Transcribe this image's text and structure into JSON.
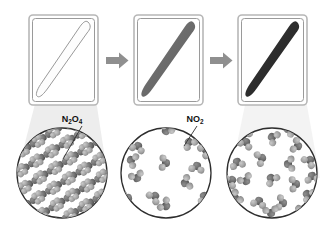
{
  "figure": {
    "width": 334,
    "height": 227,
    "background_color": "#ffffff"
  },
  "colors": {
    "tube_border_outer": "#b7b7b7",
    "tube_border_inner": "#9a9a9a",
    "tube_fill": "#ffffff",
    "sample_stage1": "#fdfdfd",
    "sample_stage1_outline": "#8d8d8d",
    "sample_stage2": "#6a6a6a",
    "sample_stage3": "#2b2b2b",
    "arrow": "#8f8f8f",
    "circle_outline": "#2d2d2d",
    "circle_fill": "#ffffff",
    "glow_cone": "#ececec",
    "atom_nitrogen": "#6e6e6e",
    "atom_oxygen": "#a8a8a8",
    "label_color": "#111111",
    "leader_line": "#2d2d2d"
  },
  "panels": [
    {
      "id": "panel-1",
      "stage": "solid",
      "sample_label": "colorless solid",
      "sample_color": "#fdfdfd",
      "magnified_state": "crystalline-lattice"
    },
    {
      "id": "panel-2",
      "stage": "partial-dissociation",
      "sample_label": "pale brown gas",
      "sample_color": "#6a6a6a",
      "magnified_state": "dispersed-gas-low-density"
    },
    {
      "id": "panel-3",
      "stage": "full-dissociation",
      "sample_label": "dark brown gas",
      "sample_color": "#2b2b2b",
      "magnified_state": "dispersed-gas-high-density"
    }
  ],
  "arrows": [
    {
      "id": "arrow-1",
      "direction": "right"
    },
    {
      "id": "arrow-2",
      "direction": "right"
    }
  ],
  "labels": [
    {
      "id": "label-n2o4",
      "base": "N",
      "sub1": "2",
      "mid": "O",
      "sub2": "4",
      "full": "N2O4",
      "display": "N₂O₄",
      "points_to": "circle-1"
    },
    {
      "id": "label-no2",
      "base": "NO",
      "sub1": "2",
      "full": "NO2",
      "display": "NO₂",
      "points_to": "circle-2"
    }
  ],
  "magnifiers": [
    {
      "id": "circle-1",
      "cx": 62,
      "cy": 173,
      "r": 45,
      "molecule_count": 0,
      "arrangement": "lattice",
      "rows": 4
    },
    {
      "id": "circle-2",
      "cx": 166,
      "cy": 173,
      "r": 45,
      "molecule_count": 14,
      "arrangement": "random"
    },
    {
      "id": "circle-3",
      "cx": 272,
      "cy": 173,
      "r": 45,
      "molecule_count": 22,
      "arrangement": "random"
    }
  ]
}
